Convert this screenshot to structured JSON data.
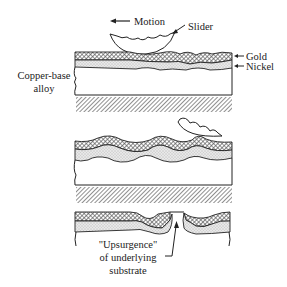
{
  "labels": {
    "motion": "Motion",
    "slider": "Slider",
    "gold": "Gold",
    "nickel": "Nickel",
    "copper_line1": "Copper-base",
    "copper_line2": "alloy",
    "upsurgence_line1": "\"Upsurgence\"",
    "upsurgence_line2": "of underlying",
    "upsurgence_line3": "substrate"
  },
  "colors": {
    "ink": "#222222",
    "background": "#ffffff",
    "nickel_fill": "#e4e4e4"
  }
}
